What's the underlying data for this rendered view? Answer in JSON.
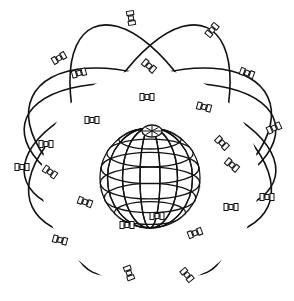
{
  "diagram": {
    "colors": {
      "line": "#111111",
      "background": "#ffffff"
    },
    "globe": {
      "cx": 150,
      "cy": 178,
      "r": 50,
      "pole": {
        "cx": 152,
        "cy": 131
      }
    },
    "orbits": [
      {
        "cx": 150,
        "cy": 150,
        "rx": 128,
        "ry": 62,
        "rot": -12
      },
      {
        "cx": 150,
        "cy": 150,
        "rx": 128,
        "ry": 62,
        "rot": 12
      },
      {
        "cx": 150,
        "cy": 152,
        "rx": 130,
        "ry": 70,
        "rot": 25
      },
      {
        "cx": 150,
        "cy": 152,
        "rx": 130,
        "ry": 70,
        "rot": -25
      },
      {
        "cx": 150,
        "cy": 150,
        "rx": 135,
        "ry": 62,
        "rot": 65
      },
      {
        "cx": 150,
        "cy": 150,
        "rx": 135,
        "ry": 62,
        "rot": -65
      }
    ],
    "satellites": [
      {
        "x": 131,
        "y": 18,
        "a": 80
      },
      {
        "x": 212,
        "y": 30,
        "a": -50
      },
      {
        "x": 59,
        "y": 58,
        "a": -30
      },
      {
        "x": 79,
        "y": 73,
        "a": -15
      },
      {
        "x": 149,
        "y": 66,
        "a": 40
      },
      {
        "x": 247,
        "y": 73,
        "a": 20
      },
      {
        "x": 147,
        "y": 97,
        "a": 0
      },
      {
        "x": 92,
        "y": 120,
        "a": 0
      },
      {
        "x": 204,
        "y": 107,
        "a": 15
      },
      {
        "x": 274,
        "y": 128,
        "a": -25
      },
      {
        "x": 46,
        "y": 144,
        "a": 0
      },
      {
        "x": 222,
        "y": 143,
        "a": 45
      },
      {
        "x": 22,
        "y": 167,
        "a": 0
      },
      {
        "x": 50,
        "y": 172,
        "a": 35
      },
      {
        "x": 85,
        "y": 202,
        "a": 20
      },
      {
        "x": 127,
        "y": 225,
        "a": 0
      },
      {
        "x": 60,
        "y": 240,
        "a": 15
      },
      {
        "x": 129,
        "y": 273,
        "a": 70
      },
      {
        "x": 232,
        "y": 165,
        "a": 40
      },
      {
        "x": 267,
        "y": 197,
        "a": 0
      },
      {
        "x": 231,
        "y": 207,
        "a": 0
      },
      {
        "x": 157,
        "y": 216,
        "a": 0
      },
      {
        "x": 195,
        "y": 233,
        "a": -20
      },
      {
        "x": 187,
        "y": 275,
        "a": 50
      }
    ]
  }
}
